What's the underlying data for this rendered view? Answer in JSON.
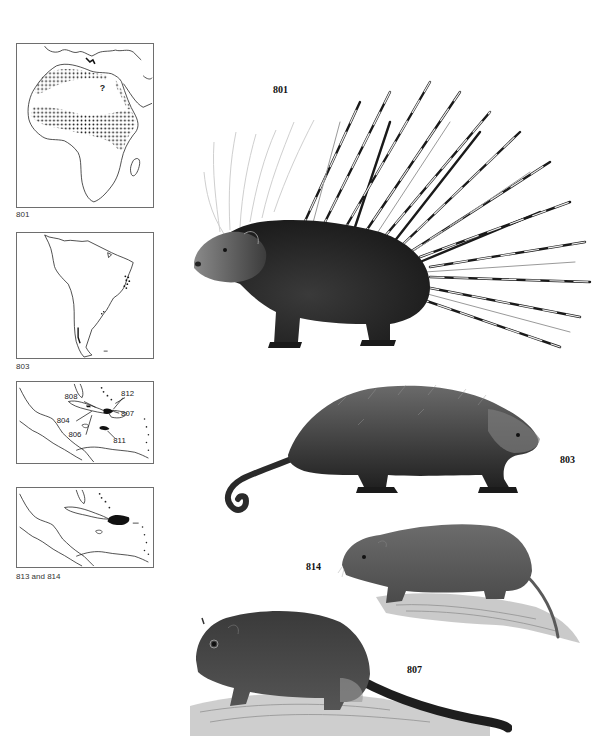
{
  "maps": [
    {
      "id": "map-801",
      "region": "Africa",
      "caption": "801",
      "annotation": "?"
    },
    {
      "id": "map-803",
      "region": "South America",
      "caption": "803"
    },
    {
      "id": "map-caribbean-multi",
      "region": "Caribbean",
      "caption": "",
      "labels": [
        "808",
        "812",
        "804",
        "807",
        "806",
        "811"
      ]
    },
    {
      "id": "map-813-814",
      "region": "Caribbean (Hispaniola)",
      "caption": "813 and 814"
    }
  ],
  "illustrations": [
    {
      "id": "801",
      "label": "801",
      "subject": "crested porcupine"
    },
    {
      "id": "803",
      "label": "803",
      "subject": "prehensile-tailed porcupine"
    },
    {
      "id": "814",
      "label": "814",
      "subject": "hutia on branch"
    },
    {
      "id": "807",
      "label": "807",
      "subject": "hutia on branch"
    }
  ],
  "colors": {
    "ink": "#111111",
    "frame": "#6e6e6e",
    "fur_dark": "#2a2a2a",
    "fur_mid": "#5a5a5a",
    "fur_light": "#8a8a8a",
    "quill_light": "#e6e6e6",
    "branch": "#b5b5b5"
  }
}
